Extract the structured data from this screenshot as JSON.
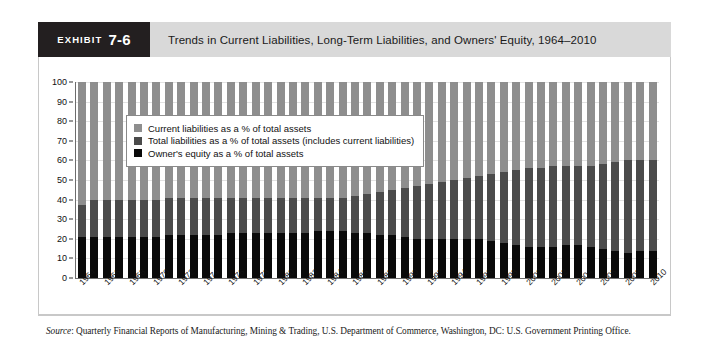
{
  "exhibit": {
    "tab_word": "EXHIBIT",
    "tab_number": "7-6",
    "title": "Trends in Current Liabilities, Long-Term Liabilities, and Owners' Equity, 1964–2010"
  },
  "source": {
    "label": "Source",
    "text": ": Quarterly Financial Reports of Manufacturing, Mining & Trading, U.S. Department of Commerce, Washington, DC: U.S. Government Printing Office."
  },
  "legend": {
    "items": [
      {
        "label": "Current liabilities as a % of total assets",
        "color": "#8e8e8e"
      },
      {
        "label": "Total liabilities as a % of total assets (includes current liabilities)",
        "color": "#4b4b4b"
      },
      {
        "label": "Owner's equity as a % of total assets",
        "color": "#0a0a0a"
      }
    ]
  },
  "chart_data": {
    "type": "bar",
    "stacked": true,
    "title": "Trends in Current Liabilities, Long-Term Liabilities, and Owners' Equity, 1964–2010",
    "xlabel": "",
    "ylabel": "",
    "ylim": [
      0,
      100
    ],
    "yticks": [
      0,
      10,
      20,
      30,
      40,
      50,
      60,
      70,
      80,
      90,
      100
    ],
    "grid": true,
    "legend_position": "top-left-inside",
    "x": [
      1964,
      1965,
      1966,
      1967,
      1968,
      1969,
      1970,
      1971,
      1972,
      1973,
      1974,
      1975,
      1976,
      1977,
      1978,
      1979,
      1980,
      1981,
      1982,
      1983,
      1984,
      1985,
      1986,
      1987,
      1988,
      1989,
      1990,
      1991,
      1992,
      1993,
      1994,
      1995,
      1996,
      1997,
      1998,
      1999,
      2000,
      2001,
      2002,
      2003,
      2004,
      2005,
      2006,
      2007,
      2008,
      2009,
      2010
    ],
    "tick_labels": [
      "1964",
      "1966",
      "1968",
      "1970",
      "1972",
      "1974",
      "1976",
      "1978",
      "1980",
      "1982",
      "1984",
      "1986",
      "1988",
      "1990",
      "1992",
      "1994",
      "1996",
      "1998",
      "2000",
      "2002",
      "2004",
      "2006",
      "2008",
      "2010"
    ],
    "series": [
      {
        "name": "Owner's equity as a % of total assets",
        "color": "#0a0a0a",
        "values": [
          21,
          21,
          21,
          21,
          21,
          21,
          21,
          22,
          22,
          22,
          22,
          22,
          23,
          23,
          23,
          23,
          23,
          23,
          23,
          24,
          24,
          24,
          23,
          23,
          22,
          22,
          21,
          20,
          20,
          20,
          20,
          20,
          20,
          19,
          18,
          17,
          16,
          16,
          16,
          17,
          17,
          16,
          15,
          14,
          13,
          14,
          14
        ]
      },
      {
        "name": "Total liabilities as a % of total assets (includes current liabilities)",
        "color": "#4b4b4b",
        "values": [
          16,
          19,
          19,
          19,
          19,
          19,
          19,
          19,
          19,
          19,
          19,
          19,
          18,
          18,
          18,
          18,
          18,
          18,
          18,
          17,
          17,
          17,
          19,
          20,
          22,
          23,
          25,
          27,
          28,
          29,
          30,
          31,
          32,
          34,
          36,
          38,
          40,
          40,
          41,
          40,
          40,
          41,
          43,
          45,
          47,
          46,
          46
        ]
      },
      {
        "name": "Current liabilities as a % of total assets",
        "color": "#8e8e8e",
        "values": [
          63,
          60,
          60,
          60,
          60,
          60,
          60,
          59,
          59,
          59,
          59,
          59,
          59,
          59,
          59,
          59,
          59,
          59,
          59,
          59,
          59,
          59,
          58,
          57,
          56,
          55,
          54,
          53,
          52,
          51,
          50,
          49,
          48,
          47,
          46,
          45,
          44,
          44,
          43,
          43,
          43,
          43,
          42,
          41,
          40,
          40,
          40
        ]
      }
    ]
  }
}
